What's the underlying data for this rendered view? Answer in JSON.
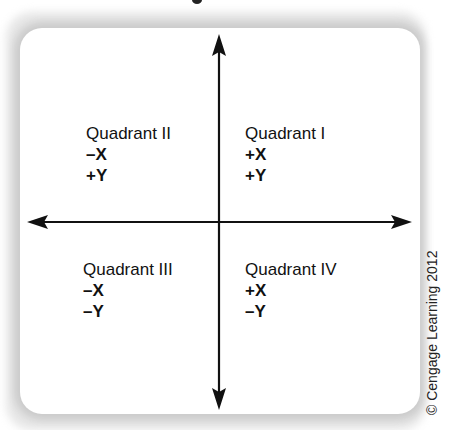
{
  "quadrants": {
    "q2": {
      "name": "Quadrant II",
      "x": "–X",
      "y": "+Y"
    },
    "q1": {
      "name": "Quadrant I",
      "x": "+X",
      "y": "+Y"
    },
    "q3": {
      "name": "Quadrant III",
      "x": "–X",
      "y": "–Y"
    },
    "q4": {
      "name": "Quadrant IV",
      "x": "+X",
      "y": "–Y"
    }
  },
  "axes": {
    "horizontal": "x-axis",
    "vertical": "y-axis",
    "color": "#111111"
  },
  "credit": "© Cengage Learning 2012"
}
